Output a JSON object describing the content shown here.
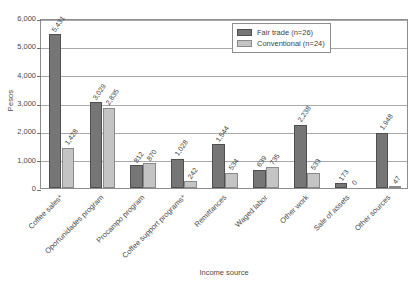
{
  "chart_data": {
    "type": "bar",
    "title": "",
    "xlabel": "Income source",
    "ylabel": "Pesos",
    "ylim": [
      0,
      6000
    ],
    "yticks": [
      0,
      1000,
      2000,
      3000,
      4000,
      5000,
      6000
    ],
    "ytick_labels": [
      "0",
      "1,000",
      "2,000",
      "3,000",
      "4,000",
      "5,000",
      "6,000"
    ],
    "grid": true,
    "legend_position": "top-right",
    "categories": [
      "Coffee sales*",
      "Oportunidades program",
      "Procampo program",
      "Coffee support programs*",
      "Remittances",
      "Waged labor",
      "Other work",
      "Sale of assets",
      "Other sources"
    ],
    "series": [
      {
        "name": "Fair trade (n=26)",
        "color": "#767676",
        "values": [
          5431,
          3029,
          812,
          1028,
          1544,
          639,
          2238,
          173,
          1948
        ],
        "value_labels": [
          "5,431",
          "3,029",
          "812",
          "1,028",
          "1,544",
          "639",
          "2,238",
          "173",
          "1,948"
        ]
      },
      {
        "name": "Conventional (n=24)",
        "color": "#c4c4c4",
        "values": [
          1428,
          2835,
          870,
          242,
          534,
          735,
          533,
          0,
          47
        ],
        "value_labels": [
          "1,428",
          "2,835",
          "870",
          "242",
          "534",
          "735",
          "533",
          "0",
          "47"
        ]
      }
    ]
  },
  "legend": {
    "items": [
      {
        "label": "Fair trade (n=26)",
        "swatch": "fair"
      },
      {
        "label": "Conventional (n=24)",
        "swatch": "conv"
      }
    ]
  }
}
